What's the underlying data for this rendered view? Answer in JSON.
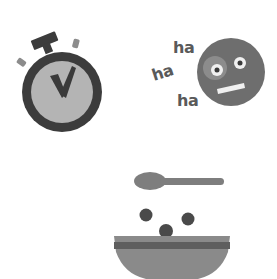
{
  "illustrations": {
    "stopwatch": {
      "label": "stopwatch",
      "colors": {
        "ring": "#3c3c3c",
        "face": "#b4b4b4",
        "hand": "#3a3a3a",
        "button": "#3c3c3c",
        "side_buttons": "#8c8c8c"
      }
    },
    "laughing_face": {
      "label": "laughing face",
      "texts": [
        "ha",
        "ha",
        "ha"
      ],
      "colors": {
        "face": "#6e6e6e",
        "cheek": "#8c8c8c",
        "eye_white": "#f0f0f0",
        "pupil": "#3a3a3a",
        "mouth": "#f0f0f0",
        "text": "#5a5a5a"
      }
    },
    "cereal_bowl": {
      "label": "cereal bowl with spoon",
      "colors": {
        "spoon": "#7e7e7e",
        "cereal": "#4a4a4a",
        "bowl": "#8a8a8a",
        "bowl_band": "#5e5e5e",
        "bowl_base": "#4a4a4a"
      }
    }
  }
}
